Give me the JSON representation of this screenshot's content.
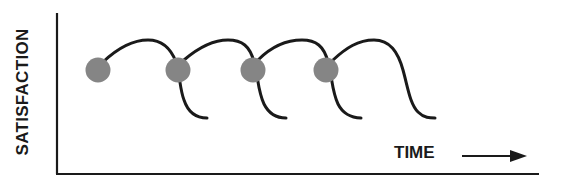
{
  "diagram": {
    "y_axis_label": "SATISFACTION",
    "x_axis_label": "TIME",
    "colors": {
      "line": "#1a1a1a",
      "node": "#858585",
      "background": "#ffffff"
    },
    "nodes": [
      {
        "label": "cycle-1"
      },
      {
        "label": "cycle-2"
      },
      {
        "label": "cycle-3"
      },
      {
        "label": "cycle-4"
      }
    ]
  }
}
